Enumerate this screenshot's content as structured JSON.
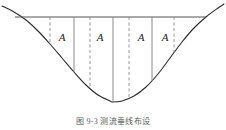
{
  "figure": {
    "caption": "图 9-3  测流垂线布设",
    "colors": {
      "curve": "#2b2b2b",
      "surface_line": "#555555",
      "solid_vertical": "#8a8a8a",
      "dashed_vertical": "#8a8a8a",
      "label_text": "#1a1a1a",
      "background": "#ffffff"
    }
  },
  "chart_data": {
    "type": "line",
    "xlabel": "",
    "ylabel": "",
    "grid": false,
    "legend": null,
    "xlim": [
      0,
      226
    ],
    "ylim": [
      0,
      118
    ],
    "water_surface_line": {
      "label": "水面线",
      "x_start": 15,
      "x_end": 206,
      "y": 17,
      "style": "solid"
    },
    "bed_profile": {
      "label": "河底断面线",
      "style": "solid",
      "points": [
        [
          2,
          6
        ],
        [
          14,
          12
        ],
        [
          26,
          20
        ],
        [
          38,
          31
        ],
        [
          50,
          44
        ],
        [
          62,
          58
        ],
        [
          74,
          72
        ],
        [
          86,
          85
        ],
        [
          98,
          95
        ],
        [
          110,
          101
        ],
        [
          113,
          102
        ],
        [
          122,
          101
        ],
        [
          134,
          96
        ],
        [
          146,
          87
        ],
        [
          158,
          74
        ],
        [
          170,
          58
        ],
        [
          182,
          42
        ],
        [
          194,
          28
        ],
        [
          206,
          17
        ],
        [
          218,
          8
        ],
        [
          224,
          4
        ]
      ]
    },
    "verticals": [
      {
        "id": "v1",
        "x": 50,
        "style": "dashed",
        "label": "",
        "y_top": 17,
        "y_bottom": 44
      },
      {
        "id": "v2",
        "x": 74,
        "style": "solid",
        "label": "",
        "y_top": 17,
        "y_bottom": 72
      },
      {
        "id": "v3",
        "x": 90,
        "style": "dashed",
        "label": "",
        "y_top": 17,
        "y_bottom": 88
      },
      {
        "id": "v4",
        "x": 113,
        "style": "solid",
        "label": "",
        "y_top": 17,
        "y_bottom": 102
      },
      {
        "id": "v5",
        "x": 129,
        "style": "dashed",
        "label": "",
        "y_top": 17,
        "y_bottom": 98
      },
      {
        "id": "v6",
        "x": 152,
        "style": "solid",
        "label": "",
        "y_top": 17,
        "y_bottom": 81
      },
      {
        "id": "v7",
        "x": 174,
        "style": "dashed",
        "label": "",
        "y_top": 17,
        "y_bottom": 52
      }
    ],
    "segments": [
      {
        "id": "seg1",
        "label": "A",
        "label_x": 62,
        "label_y": 38
      },
      {
        "id": "seg2",
        "label": "A",
        "label_x": 100,
        "label_y": 38
      },
      {
        "id": "seg3",
        "label": "A",
        "label_x": 141,
        "label_y": 38
      },
      {
        "id": "seg4",
        "label": "A",
        "label_x": 165,
        "label_y": 38
      }
    ]
  }
}
